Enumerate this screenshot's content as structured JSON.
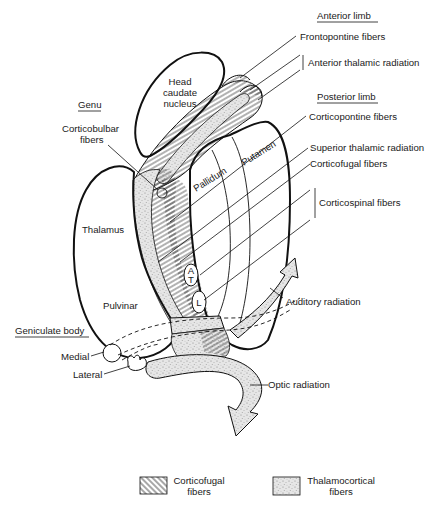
{
  "figure": {
    "type": "anatomical-diagram"
  },
  "section_headings": {
    "anterior_limb": "Anterior limb",
    "genu": "Genu",
    "posterior_limb": "Posterior limb",
    "geniculate_body": "Geniculate body"
  },
  "structures": {
    "head_caudate_1": "Head",
    "head_caudate_2": "caudate",
    "head_caudate_3": "nucleus",
    "pallidum": "Pallidum",
    "putamen": "Putamen",
    "thalamus": "Thalamus",
    "pulvinar": "Pulvinar",
    "medial": "Medial",
    "lateral": "Lateral",
    "marker_a": "A",
    "marker_t": "T",
    "marker_l": "L"
  },
  "fiber_labels": {
    "frontopontine": "Frontopontine fibers",
    "anterior_thalamic": "Anterior thalamic radiation",
    "corticobulbar_1": "Corticobulbar",
    "corticobulbar_2": "fibers",
    "corticopontine": "Corticopontine fibers",
    "superior_thalamic": "Superior thalamic radiation",
    "corticofugal": "Corticofugal fibers",
    "corticospinal": "Corticospinal fibers",
    "auditory": "Auditory radiation",
    "optic": "Optic radiation"
  },
  "legend": {
    "items": [
      {
        "pattern": "hatched",
        "label_1": "Corticofugal",
        "label_2": "fibers"
      },
      {
        "pattern": "stippled",
        "label_1": "Thalamocortical",
        "label_2": "fibers"
      }
    ]
  },
  "colors": {
    "ink": "#111111",
    "background": "#ffffff",
    "stipple": "#d9d9d9"
  }
}
